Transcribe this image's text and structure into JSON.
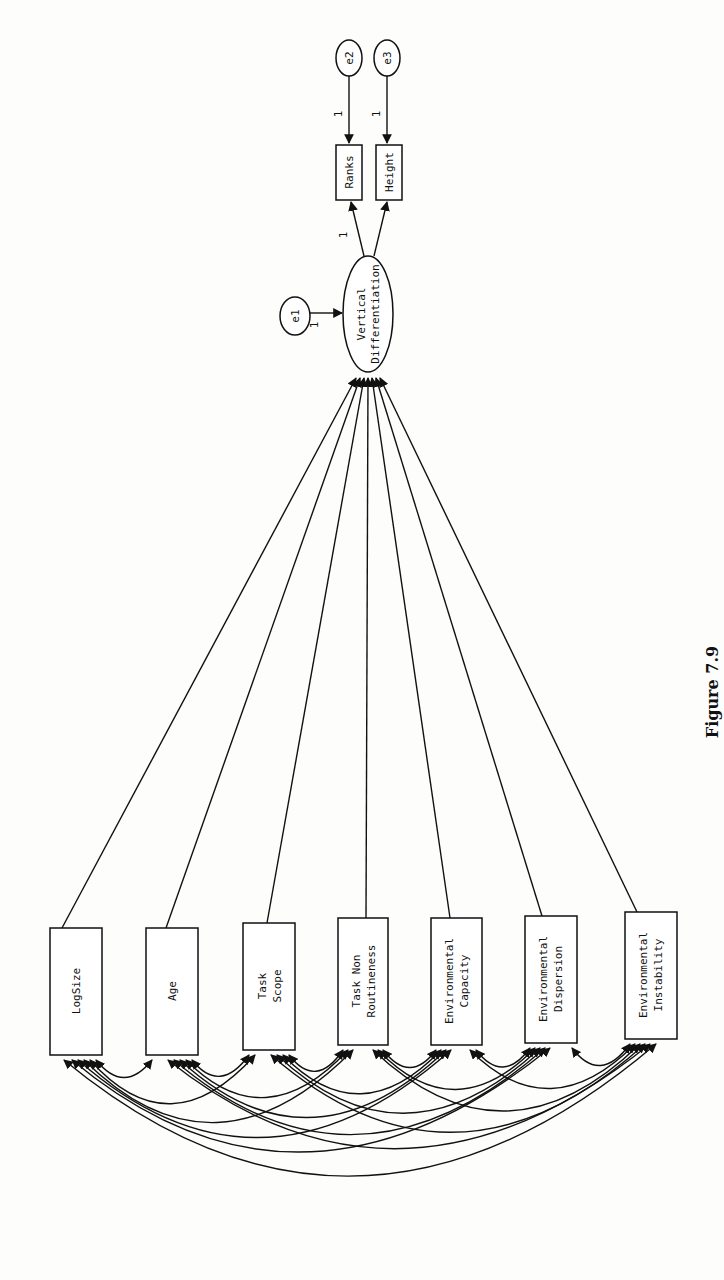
{
  "caption": "Figure 7.9",
  "latent": {
    "label_line1": "Vertical",
    "label_line2": "Differentiation",
    "error": "e1",
    "error_weight": "1"
  },
  "indicators": [
    {
      "label": "Ranks",
      "error": "e2",
      "loading": "1",
      "error_weight": "1"
    },
    {
      "label": "Height",
      "error": "e3",
      "loading": "",
      "error_weight": "1"
    }
  ],
  "predictors": [
    {
      "line1": "LogSize",
      "line2": ""
    },
    {
      "line1": "Age",
      "line2": ""
    },
    {
      "line1": "Task",
      "line2": "Scope"
    },
    {
      "line1": "Task Non",
      "line2": "Routineness"
    },
    {
      "line1": "Environmental",
      "line2": "Capacity"
    },
    {
      "line1": "Environmental",
      "line2": "Dispersion"
    },
    {
      "line1": "Environmental",
      "line2": "Instability"
    }
  ],
  "colors": {
    "ink": "#111111",
    "paper": "#fdfdfc"
  }
}
